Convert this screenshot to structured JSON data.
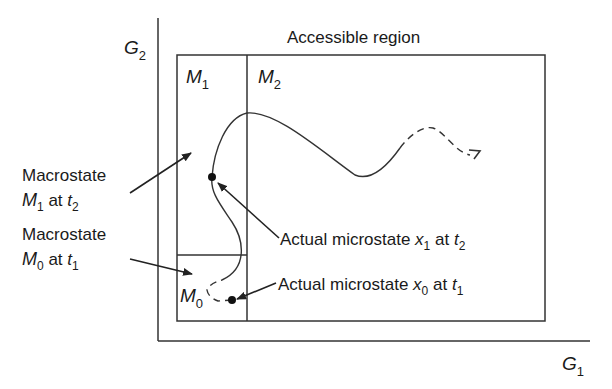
{
  "diagram": {
    "axes": {
      "y_label": "G",
      "y_label_sub": "2",
      "x_label": "G",
      "x_label_sub": "1"
    },
    "region_title": "Accessible region",
    "cells": {
      "m1": {
        "letter": "M",
        "sub": "1"
      },
      "m2": {
        "letter": "M",
        "sub": "2"
      },
      "m0": {
        "letter": "M",
        "sub": "0"
      }
    },
    "annotations": {
      "macro_m1": {
        "line1": "Macrostate",
        "var": "M",
        "var_sub": "1",
        "mid": " at ",
        "time": "t",
        "time_sub": "2"
      },
      "macro_m0": {
        "line1": "Macrostate",
        "var": "M",
        "var_sub": "0",
        "mid": " at ",
        "time": "t",
        "time_sub": "1"
      },
      "micro_x1": {
        "prefix": "Actual microstate ",
        "var": "x",
        "var_sub": "1",
        "mid": " at ",
        "time": "t",
        "time_sub": "2"
      },
      "micro_x0": {
        "prefix": "Actual microstate ",
        "var": "x",
        "var_sub": "0",
        "mid": " at ",
        "time": "t",
        "time_sub": "1"
      }
    },
    "colors": {
      "line": "#333333",
      "text": "#1a1a1a",
      "background": "#ffffff"
    }
  }
}
